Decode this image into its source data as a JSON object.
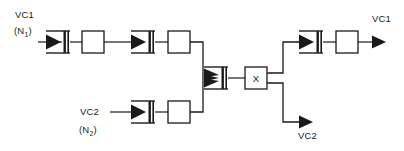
{
  "diagram": {
    "type": "signal-flow-block-diagram",
    "stroke_color": "#1a1a1a",
    "fill_color": "#ffffff",
    "background": "#ffffff",
    "labels": {
      "input_vc1": "VC1",
      "input_vc1_count_prefix": "(N",
      "input_vc1_count_sub": "1",
      "input_vc1_count_suffix": ")",
      "input_vc2": "VC2",
      "input_vc2_count_prefix": "(N",
      "input_vc2_count_sub": "2",
      "input_vc2_count_suffix": ")",
      "output_vc1": "VC1",
      "output_vc2": "VC2",
      "cross_connect": "X"
    },
    "nodes": [
      {
        "id": "in-vc1-funnel-1",
        "kind": "funnel-multiplexer",
        "row": "top",
        "order": 1
      },
      {
        "id": "in-vc1-box-1",
        "kind": "process-box",
        "row": "top",
        "order": 2
      },
      {
        "id": "in-vc1-funnel-2",
        "kind": "funnel-multiplexer",
        "row": "top",
        "order": 3
      },
      {
        "id": "in-vc1-box-2",
        "kind": "process-box",
        "row": "top",
        "order": 4
      },
      {
        "id": "in-vc2-funnel-1",
        "kind": "funnel-multiplexer",
        "row": "bottom",
        "order": 1
      },
      {
        "id": "in-vc2-box-1",
        "kind": "process-box",
        "row": "bottom",
        "order": 2
      },
      {
        "id": "merge-funnel",
        "kind": "funnel-multiplexer-triple",
        "row": "center",
        "order": 1
      },
      {
        "id": "cross-connect-box",
        "kind": "labeled-box",
        "row": "center",
        "order": 2,
        "label": "X"
      },
      {
        "id": "out-vc1-funnel",
        "kind": "funnel-multiplexer",
        "row": "top-right",
        "order": 1
      },
      {
        "id": "out-vc1-box",
        "kind": "process-box",
        "row": "top-right",
        "order": 2
      }
    ],
    "flows": [
      {
        "from": "input_vc1",
        "to": "merge-funnel",
        "path": "top"
      },
      {
        "from": "input_vc2",
        "to": "merge-funnel",
        "path": "bottom"
      },
      {
        "from": "cross-connect-box",
        "to": "output_vc1",
        "path": "top-right"
      },
      {
        "from": "cross-connect-box",
        "to": "output_vc2",
        "path": "bottom-right"
      }
    ]
  }
}
